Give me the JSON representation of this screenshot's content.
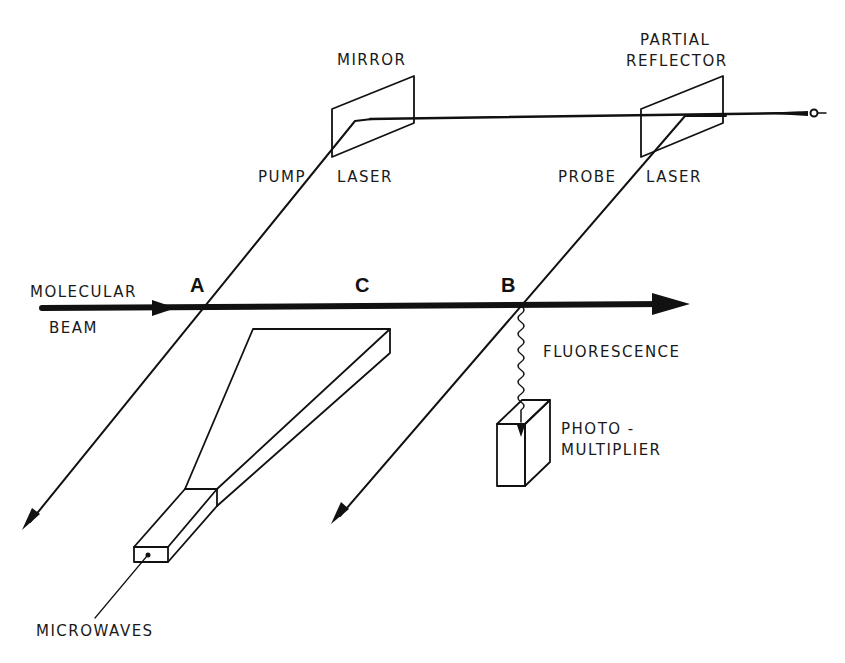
{
  "diagram": {
    "title": "",
    "type": "experimental setup schematic (microwave-optical double resonance)",
    "colors": {
      "ink": "#111111",
      "background": "#ffffff"
    },
    "labels": {
      "mirror": "MIRROR",
      "partial_reflector_line1": "PARTIAL",
      "partial_reflector_line2": "REFLECTOR",
      "pump": "PUMP",
      "pump_laser": "LASER",
      "probe": "PROBE",
      "probe_laser": "LASER",
      "molecular": "MOLECULAR",
      "beam": "BEAM",
      "fluorescence": "FLUORESCENCE",
      "photo": "PHOTO -",
      "multiplier": "MULTIPLIER",
      "microwaves": "MICROWAVES"
    },
    "points": {
      "a": "A",
      "b": "B",
      "c": "C"
    },
    "nodes": [
      {
        "id": "mirror",
        "label": "MIRROR"
      },
      {
        "id": "partial-reflector",
        "label": "PARTIAL REFLECTOR"
      },
      {
        "id": "pump-laser",
        "label": "PUMP LASER"
      },
      {
        "id": "probe-laser",
        "label": "PROBE LASER"
      },
      {
        "id": "molecular-beam",
        "label": "MOLECULAR BEAM"
      },
      {
        "id": "photomultiplier",
        "label": "PHOTO-MULTIPLIER"
      },
      {
        "id": "microwave-horn",
        "label": "MICROWAVES"
      }
    ],
    "edges": [
      {
        "from": "laser-source",
        "to": "partial-reflector",
        "label": ""
      },
      {
        "from": "partial-reflector",
        "to": "mirror",
        "label": ""
      },
      {
        "from": "mirror",
        "to": "A",
        "label": "PUMP LASER"
      },
      {
        "from": "partial-reflector",
        "to": "B",
        "label": "PROBE LASER"
      },
      {
        "from": "B",
        "to": "photomultiplier",
        "label": "FLUORESCENCE"
      },
      {
        "from": "microwave-horn",
        "to": "C",
        "label": "MICROWAVES"
      }
    ]
  }
}
